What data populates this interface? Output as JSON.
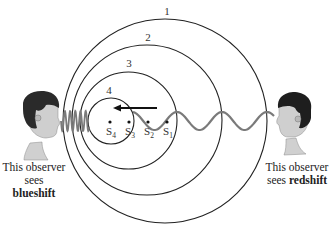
{
  "diagram": {
    "circles": [
      {
        "label": "1",
        "cx": 165,
        "cy": 121,
        "r": 102,
        "label_x": 167,
        "label_y": 15
      },
      {
        "label": "2",
        "cx": 147,
        "cy": 120,
        "r": 75,
        "label_x": 148,
        "label_y": 41
      },
      {
        "label": "3",
        "cx": 128.5,
        "cy": 120.5,
        "r": 48.5,
        "label_x": 129,
        "label_y": 67
      },
      {
        "label": "4",
        "cx": 111,
        "cy": 121,
        "r": 23,
        "label_x": 109,
        "label_y": 94
      }
    ],
    "source_positions": [
      {
        "label": "S",
        "sub": "1",
        "x": 167,
        "y": 122
      },
      {
        "label": "S",
        "sub": "2",
        "x": 148,
        "y": 122
      },
      {
        "label": "S",
        "sub": "3",
        "x": 129,
        "y": 122
      },
      {
        "label": "S",
        "sub": "4",
        "x": 110,
        "y": 122
      }
    ],
    "motion_arrow": {
      "x1": 157,
      "x2": 113,
      "y": 108,
      "direction": "left"
    },
    "wave_color": "#7a7a7a",
    "line_color": "#222222"
  },
  "observers": {
    "left": {
      "line1": "This observer",
      "line2_prefix": "sees ",
      "line2_bold": "blueshift"
    },
    "right": {
      "line1": "This observer",
      "line2_prefix": "sees ",
      "line2_bold": "redshift"
    }
  }
}
